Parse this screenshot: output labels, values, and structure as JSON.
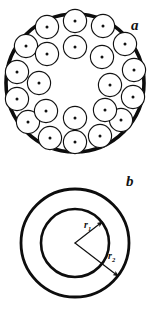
{
  "figure": {
    "width": 158,
    "height": 311,
    "background_color": "#ffffff",
    "ink_color": "#111111",
    "panels": [
      {
        "id": "panel-a",
        "label": "a",
        "label_position": {
          "x": 131,
          "y": 30
        },
        "description": "cable cross-section with circular strands packed in two concentric rings inside a thick outer jacket boundary, hollow core",
        "boundary": {
          "cx": 75,
          "cy": 83,
          "r": 69,
          "stroke_width": 3.6
        },
        "strand_radius": 11.6,
        "strand_dot_radius": 1.5,
        "strand_count": 22,
        "strands": [
          {
            "cx": 75,
            "cy": 21
          },
          {
            "cx": 103,
            "cy": 26
          },
          {
            "cx": 47,
            "cy": 27
          },
          {
            "cx": 125,
            "cy": 44
          },
          {
            "cx": 26,
            "cy": 46
          },
          {
            "cx": 134,
            "cy": 70
          },
          {
            "cx": 17,
            "cy": 72
          },
          {
            "cx": 133,
            "cy": 97
          },
          {
            "cx": 17,
            "cy": 99
          },
          {
            "cx": 121,
            "cy": 120
          },
          {
            "cx": 28,
            "cy": 122
          },
          {
            "cx": 100,
            "cy": 136
          },
          {
            "cx": 50,
            "cy": 138
          },
          {
            "cx": 75,
            "cy": 142
          },
          {
            "cx": 75,
            "cy": 47
          },
          {
            "cx": 102,
            "cy": 57
          },
          {
            "cx": 47,
            "cy": 54
          },
          {
            "cx": 110,
            "cy": 85
          },
          {
            "cx": 39,
            "cy": 83
          },
          {
            "cx": 105,
            "cy": 110
          },
          {
            "cx": 46,
            "cy": 111
          },
          {
            "cx": 75,
            "cy": 118
          }
        ]
      },
      {
        "id": "panel-b",
        "label": "b",
        "label_position": {
          "x": 126,
          "y": 186
        },
        "description": "annular tube model: two concentric circles with inner radius r1 and outer radius r2 drawn as arrows from the common center",
        "center": {
          "x": 75,
          "y": 243
        },
        "inner_circle": {
          "r": 34,
          "stroke_width": 2.6
        },
        "outer_circle": {
          "r": 54,
          "stroke_width": 2.8
        },
        "radius_arrows": [
          {
            "name": "r1",
            "label_text": "r",
            "label_subscript": "1",
            "label_position": {
              "x": 84,
              "y": 228
            },
            "angle_deg": -38,
            "from": {
              "x": 75,
              "y": 243
            },
            "to": {
              "x": 102,
              "y": 222
            }
          },
          {
            "name": "r2",
            "label_text": "r",
            "label_subscript": "2",
            "label_position": {
              "x": 108,
              "y": 259
            },
            "angle_deg": 38,
            "from": {
              "x": 75,
              "y": 243
            },
            "to": {
              "x": 118,
              "y": 276
            }
          }
        ]
      }
    ]
  }
}
